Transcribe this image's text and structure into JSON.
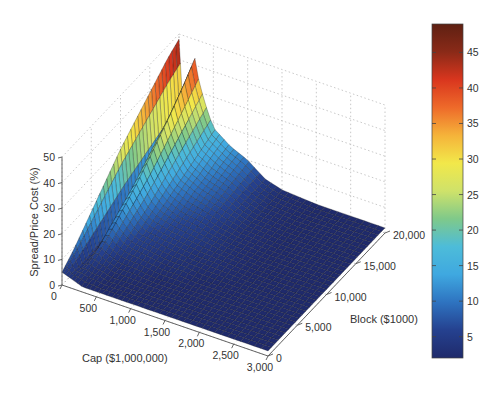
{
  "chart_data": {
    "type": "surface",
    "title": "",
    "xlabel": "Cap ($1,000,000)",
    "ylabel": "Block ($1000)",
    "zlabel": "Spread/Price Cost (%)",
    "x_ticks": [
      "0",
      "500",
      "1,000",
      "1,500",
      "2,000",
      "2,500",
      "3,000"
    ],
    "x_tick_values": [
      0,
      500,
      1000,
      1500,
      2000,
      2500,
      3000
    ],
    "y_ticks": [
      "0",
      "5,000",
      "10,000",
      "15,000",
      "20,000"
    ],
    "y_tick_values": [
      0,
      5000,
      10000,
      15000,
      20000
    ],
    "z_ticks": [
      "0",
      "10",
      "20",
      "30",
      "40",
      "50"
    ],
    "z_tick_values": [
      0,
      10,
      20,
      30,
      40,
      50
    ],
    "xlim": [
      0,
      3000
    ],
    "ylim": [
      0,
      20000
    ],
    "zlim": [
      0,
      50
    ],
    "grid": true,
    "colormap": "jet-like (dark blue to dark red)",
    "colorbar": {
      "range": [
        2,
        49
      ],
      "ticks": [
        "5",
        "10",
        "15",
        "20",
        "25",
        "30",
        "35",
        "40",
        "45"
      ],
      "tick_values": [
        5,
        10,
        15,
        20,
        25,
        30,
        35,
        40,
        45
      ]
    },
    "x_samples": [
      0,
      100,
      200,
      300,
      400,
      500,
      750,
      1000,
      1250,
      1500,
      2000,
      2500,
      3000
    ],
    "y_samples": [
      0,
      2000,
      4000,
      6000,
      8000,
      10000,
      12000,
      14000,
      16000,
      18000,
      20000
    ],
    "z_grid_description": "rows = x_samples (Cap), columns = y_samples (Block)",
    "z": [
      [
        5,
        9,
        14,
        19,
        24,
        29,
        33,
        37,
        41,
        45,
        48
      ],
      [
        4,
        3,
        3,
        3,
        3,
        3,
        3,
        3,
        3,
        3,
        3
      ],
      [
        3,
        4,
        7,
        11,
        15,
        19,
        24,
        29,
        34,
        40,
        47
      ],
      [
        2,
        3,
        5,
        8,
        11,
        14,
        17,
        21,
        25,
        29,
        33
      ],
      [
        2,
        3,
        4,
        6,
        8,
        10,
        13,
        16,
        19,
        22,
        25
      ],
      [
        2,
        2,
        3,
        5,
        6,
        8,
        10,
        12,
        14,
        16,
        18
      ],
      [
        2,
        2,
        3,
        4,
        5,
        6,
        7,
        9,
        10,
        12,
        13
      ],
      [
        2,
        2,
        2,
        3,
        4,
        5,
        6,
        7,
        8,
        9,
        10
      ],
      [
        2,
        2,
        2,
        3,
        3,
        4,
        4,
        5,
        5,
        5,
        5
      ],
      [
        2,
        2,
        2,
        2,
        3,
        3,
        3,
        3,
        3,
        3,
        3
      ],
      [
        2,
        2,
        2,
        2,
        2,
        2,
        2,
        2,
        2,
        2,
        2
      ],
      [
        2,
        2,
        2,
        2,
        2,
        2,
        2,
        2,
        2,
        2,
        2
      ],
      [
        2,
        2,
        2,
        2,
        2,
        2,
        2,
        2,
        2,
        2,
        2
      ]
    ]
  },
  "colors": {
    "text": "#333333",
    "axis": "#555555",
    "grid": "#bbbbbb",
    "mesh_edge": "#1a1a1a",
    "colormap_stops": [
      "#1f2a6b",
      "#25418f",
      "#2e73c0",
      "#3fa8e0",
      "#4dbcd9",
      "#7fc98a",
      "#cfe26a",
      "#f2e84a",
      "#f5b33a",
      "#ee6a2a",
      "#d9361e",
      "#8a2a18",
      "#5e2012"
    ]
  }
}
